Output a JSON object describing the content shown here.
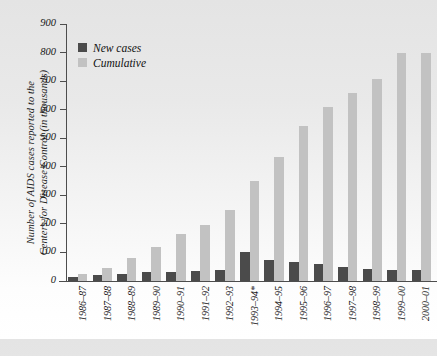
{
  "chart_data": {
    "type": "bar",
    "title": "",
    "xlabel": "",
    "ylabel": "Number of AIDS cases reported to the\nCenters for Disease Control (in thousands)",
    "ylim": [
      0,
      900
    ],
    "ytick_step": 100,
    "yticks": [
      900,
      800,
      700,
      600,
      500,
      400,
      300,
      200,
      100,
      0
    ],
    "grid": false,
    "legend_position": "top-left",
    "categories": [
      "1986–87",
      "1987–88",
      "1988–89",
      "1989–90",
      "1990–91",
      "1991–92",
      "1992–93",
      "1993–94*",
      "1994–95",
      "1995–96",
      "1996–97",
      "1997–98",
      "1998–99",
      "1999–00",
      "2000–01"
    ],
    "series": [
      {
        "name": "New cases",
        "color": "#4b4b4b",
        "values": [
          13,
          20,
          26,
          30,
          33,
          36,
          38,
          101,
          75,
          68,
          60,
          50,
          42,
          38,
          40
        ]
      },
      {
        "name": "Cumulative",
        "color": "#c2c2c2",
        "values": [
          23,
          45,
          80,
          120,
          163,
          196,
          247,
          352,
          433,
          543,
          608,
          660,
          708,
          800,
          800
        ]
      }
    ],
    "footnote_marker": "*"
  },
  "legend": {
    "items": [
      {
        "label": "New cases",
        "swatch": "dark-gray-swatch"
      },
      {
        "label": "Cumulative",
        "swatch": "light-gray-swatch"
      }
    ]
  }
}
